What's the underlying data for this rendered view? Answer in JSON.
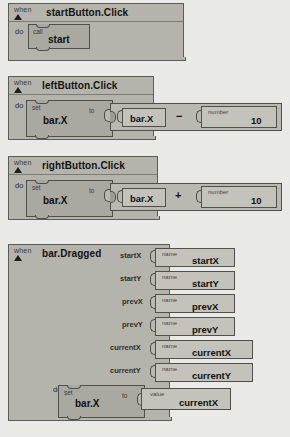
{
  "app": {
    "name": "MIT App Inventor Blocks Editor",
    "canvas_label": "blocks-canvas"
  },
  "labels": {
    "when": "when",
    "do": "do",
    "call": "call",
    "set": "set",
    "to": "to",
    "name": "name",
    "value": "value",
    "number": "number"
  },
  "colors": {
    "canvas": "#e9e9e5",
    "event_block": "#b4b4ac",
    "statement_block": "#a9a9a1",
    "value_block": "#c3c3bb",
    "outline": "#4f4f4b",
    "text": "#111110"
  },
  "blocks": [
    {
      "id": "start-button-click",
      "event": "startButton.Click",
      "body": [
        {
          "kind": "call",
          "keyword": "call",
          "procedure": "start"
        }
      ]
    },
    {
      "id": "left-button-click",
      "event": "leftButton.Click",
      "body": [
        {
          "kind": "set",
          "keyword": "set",
          "property": "bar.X",
          "to": "to",
          "expression": {
            "left": {
              "kind": "getter",
              "text": "bar.X"
            },
            "operator": "−",
            "right": {
              "kind": "number",
              "label": "number",
              "value": "10"
            }
          }
        }
      ]
    },
    {
      "id": "right-button-click",
      "event": "rightButton.Click",
      "body": [
        {
          "kind": "set",
          "keyword": "set",
          "property": "bar.X",
          "to": "to",
          "expression": {
            "left": {
              "kind": "getter",
              "text": "bar.X"
            },
            "operator": "+",
            "right": {
              "kind": "number",
              "label": "number",
              "value": "10"
            }
          }
        }
      ]
    },
    {
      "id": "bar-dragged",
      "event": "bar.Dragged",
      "parameters": [
        {
          "name": "startX",
          "binding_label": "name",
          "binding_value": "startX"
        },
        {
          "name": "startY",
          "binding_label": "name",
          "binding_value": "startY"
        },
        {
          "name": "prevX",
          "binding_label": "name",
          "binding_value": "prevX"
        },
        {
          "name": "prevY",
          "binding_label": "name",
          "binding_value": "prevY"
        },
        {
          "name": "currentX",
          "binding_label": "name",
          "binding_value": "currentX"
        },
        {
          "name": "currentY",
          "binding_label": "name",
          "binding_value": "currentY"
        }
      ],
      "body": [
        {
          "kind": "set",
          "keyword": "set",
          "property": "bar.X",
          "to": "to",
          "expression": {
            "left": {
              "kind": "value-getter",
              "label": "value",
              "text": "currentX"
            }
          }
        }
      ]
    }
  ]
}
